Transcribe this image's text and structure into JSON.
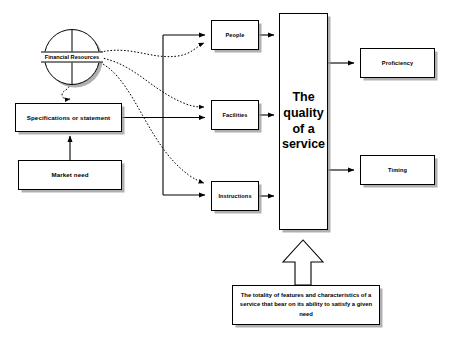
{
  "diagram": {
    "title": "The quality of a service",
    "type": "block-flow-diagram",
    "nodes": {
      "financial_resources": {
        "label_line1": "Financial",
        "label_line2": "Resources",
        "shape": "circle"
      },
      "specifications": {
        "label": "Specifications or statement",
        "shape": "rectangle"
      },
      "market_need": {
        "label": "Market need",
        "shape": "rectangle"
      },
      "people": {
        "label": "People",
        "shape": "rectangle"
      },
      "facilities": {
        "label": "Facilities",
        "shape": "rectangle"
      },
      "instructions": {
        "label": "Instructions",
        "shape": "rectangle"
      },
      "quality": {
        "label": "The quality of a service",
        "shape": "rectangle-tall"
      },
      "proficiency": {
        "label": "Proficiency",
        "shape": "rectangle"
      },
      "timing": {
        "label": "Timing",
        "shape": "rectangle"
      },
      "definition": {
        "label": "The totality of features and characteristics of a service that bear on its ability to satisfy a given need",
        "shape": "rectangle"
      }
    },
    "connectors": {
      "market_to_spec": {
        "style": "solid",
        "from": "market_need",
        "to": "specifications"
      },
      "finance_to_spec": {
        "style": "dotted",
        "from": "financial_resources",
        "to": "specifications"
      },
      "spec_to_trunk": {
        "style": "solid",
        "from": "specifications",
        "to": "trunk"
      },
      "trunk_to_people": {
        "style": "solid",
        "from": "trunk",
        "to": "people"
      },
      "trunk_to_facilities": {
        "style": "solid",
        "from": "trunk",
        "to": "facilities"
      },
      "trunk_to_instructions": {
        "style": "solid",
        "from": "trunk",
        "to": "instructions"
      },
      "finance_to_people": {
        "style": "dotted",
        "from": "financial_resources",
        "to": "people"
      },
      "finance_to_facilities": {
        "style": "dotted",
        "from": "financial_resources",
        "to": "facilities"
      },
      "finance_to_instructions": {
        "style": "dotted",
        "from": "financial_resources",
        "to": "instructions"
      },
      "people_to_quality": {
        "style": "solid",
        "from": "people",
        "to": "quality"
      },
      "facilities_to_quality": {
        "style": "solid",
        "from": "facilities",
        "to": "quality"
      },
      "instructions_to_quality": {
        "style": "solid",
        "from": "instructions",
        "to": "quality"
      },
      "quality_to_proficiency": {
        "style": "solid",
        "from": "quality",
        "to": "proficiency"
      },
      "quality_to_timing": {
        "style": "solid",
        "from": "quality",
        "to": "timing"
      },
      "definition_to_quality": {
        "style": "block-arrow",
        "from": "definition",
        "to": "quality"
      }
    },
    "colors": {
      "line": "#000000",
      "fill": "#ffffff",
      "shadow": "#969696",
      "background": "#ffffff"
    }
  }
}
